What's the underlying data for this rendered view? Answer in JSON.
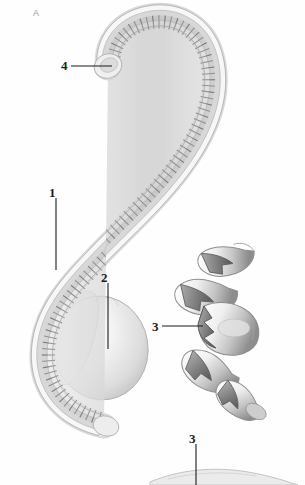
{
  "figure": {
    "panel_label": "A",
    "background_color": "#fefefe",
    "ink_color": "#1b1b1b",
    "technique": "grayscale-stipple-line-drawing"
  },
  "labels": [
    {
      "id": "label-1",
      "text": "1",
      "x": 49,
      "y": 186,
      "leader": {
        "type": "vertical",
        "x": 56,
        "y1": 198,
        "y2": 270
      },
      "points_to": "vertebral-column-shaft"
    },
    {
      "id": "label-2",
      "text": "2",
      "x": 101,
      "y": 271,
      "leader": {
        "type": "vertical",
        "x": 108,
        "y1": 283,
        "y2": 349
      },
      "points_to": "ovoid-mass"
    },
    {
      "id": "label-3a",
      "text": "3",
      "x": 152,
      "y": 320,
      "leader": {
        "type": "horizontal",
        "y": 326,
        "x1": 162,
        "x2": 203
      },
      "points_to": "vertebra-detail"
    },
    {
      "id": "label-4",
      "text": "4",
      "x": 61,
      "y": 59,
      "leader": {
        "type": "horizontal",
        "y": 66,
        "x1": 71,
        "x2": 112
      },
      "points_to": "anterior-hook-terminus"
    },
    {
      "id": "label-3b",
      "text": "3",
      "x": 189,
      "y": 432,
      "leader": {
        "type": "vertical",
        "x": 196,
        "y1": 444,
        "y2": 485
      },
      "points_to": "lower-fragment"
    }
  ],
  "structures": [
    {
      "id": "vertebral-column",
      "name": "s-curved-segmented-column",
      "segment_count": 96
    },
    {
      "id": "ovoid-mass",
      "name": "ovoid-body-mass"
    },
    {
      "id": "vertebra-detail-stack",
      "name": "isolated-vertebrae-detail",
      "element_count": 4
    },
    {
      "id": "lower-fragment",
      "name": "bottom-edge-fragment"
    }
  ]
}
